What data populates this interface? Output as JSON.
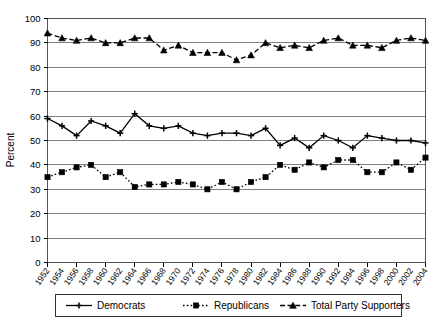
{
  "chart_data": {
    "type": "line",
    "title": "",
    "xlabel": "",
    "ylabel": "Percent",
    "ylim": [
      0,
      100
    ],
    "ytick_step": 10,
    "yticks": [
      0,
      10,
      20,
      30,
      40,
      50,
      60,
      70,
      80,
      90,
      100
    ],
    "grid": true,
    "grid_axis": "y",
    "legend_position": "bottom",
    "x": [
      1952,
      1954,
      1956,
      1958,
      1960,
      1962,
      1964,
      1966,
      1968,
      1970,
      1972,
      1974,
      1976,
      1978,
      1980,
      1982,
      1984,
      1986,
      1988,
      1990,
      1992,
      1994,
      1996,
      1998,
      2000,
      2002,
      2004
    ],
    "categories": [
      "1952",
      "1954",
      "1956",
      "1958",
      "1960",
      "1962",
      "1964",
      "1966",
      "1968",
      "1970",
      "1972",
      "1974",
      "1976",
      "1978",
      "1980",
      "1982",
      "1984",
      "1986",
      "1988",
      "1990",
      "1992",
      "1994",
      "1996",
      "1998",
      "2000",
      "2002",
      "2004"
    ],
    "series": [
      {
        "name": "Democrats",
        "marker": "cross",
        "line_style": "solid",
        "color": "#000000",
        "values": [
          59,
          56,
          52,
          58,
          56,
          53,
          61,
          56,
          55,
          56,
          53,
          52,
          53,
          53,
          52,
          55,
          48,
          51,
          47,
          52,
          50,
          47,
          52,
          51,
          50,
          50,
          49
        ]
      },
      {
        "name": "Republicans",
        "marker": "square",
        "line_style": "dotted",
        "color": "#000000",
        "values": [
          35,
          37,
          39,
          40,
          35,
          37,
          31,
          32,
          32,
          33,
          32,
          30,
          33,
          30,
          33,
          35,
          40,
          38,
          41,
          39,
          42,
          42,
          37,
          37,
          41,
          38,
          43
        ]
      },
      {
        "name": "Total Party Supporters",
        "marker": "triangle",
        "line_style": "dashed",
        "color": "#000000",
        "values": [
          94,
          92,
          91,
          92,
          90,
          90,
          92,
          92,
          87,
          89,
          86,
          86,
          86,
          83,
          85,
          90,
          88,
          89,
          88,
          91,
          92,
          89,
          89,
          88,
          91,
          92,
          91
        ]
      }
    ]
  },
  "legend": {
    "items": [
      {
        "label": "Democrats"
      },
      {
        "label": "Republicans"
      },
      {
        "label": "Total Party Supporters"
      }
    ]
  }
}
